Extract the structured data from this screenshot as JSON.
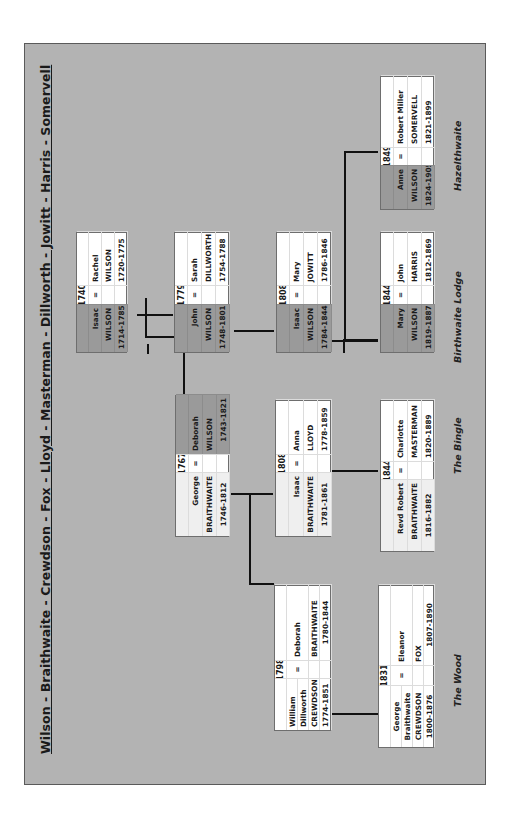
{
  "title": "Wilson - Braithwaite - Crewdson - Fox - Lloyd - Masterman - Dillworth - Jowitt - Harris - Somervell",
  "places": [
    {
      "label": "Hazelthwaite"
    },
    {
      "label": "Birthwaite Lodge"
    },
    {
      "label": "The Bingle"
    },
    {
      "label": "The Wood"
    }
  ],
  "couples": [
    {
      "id": "isaac-rachel",
      "year": "1740",
      "eq": "=",
      "left": {
        "names": [
          "Isaac",
          "WILSON"
        ],
        "dates": "1714-1785",
        "shade": "dark"
      },
      "right": {
        "names": [
          "Rachel",
          "WILSON"
        ],
        "dates": "1720-1775",
        "shade": "white"
      }
    },
    {
      "id": "john-sarah",
      "year": "1779",
      "eq": "=",
      "left": {
        "names": [
          "John",
          "WILSON"
        ],
        "dates": "1748-1801",
        "shade": "dark"
      },
      "right": {
        "names": [
          "Sarah",
          "DILLWORTH"
        ],
        "dates": "1754-1788",
        "shade": "white"
      }
    },
    {
      "id": "isaac-mary",
      "year": "1808",
      "eq": "=",
      "left": {
        "names": [
          "Isaac",
          "WILSON"
        ],
        "dates": "1784-1844",
        "shade": "dark"
      },
      "right": {
        "names": [
          "Mary",
          "JOWITT"
        ],
        "dates": "1786-1846",
        "shade": "white"
      }
    },
    {
      "id": "mary-john",
      "year": "1844",
      "eq": "=",
      "left": {
        "names": [
          "Mary",
          "WILSON"
        ],
        "dates": "1819-1887",
        "shade": "dark"
      },
      "right": {
        "names": [
          "John",
          "HARRIS"
        ],
        "dates": "1812-1869",
        "shade": "white"
      }
    },
    {
      "id": "anne-robert",
      "year": "1849",
      "eq": "=",
      "left": {
        "names": [
          "Anne",
          "WILSON"
        ],
        "dates": "1824-1905",
        "shade": "dark"
      },
      "right": {
        "names": [
          "Robert Miller",
          "SOMERVELL"
        ],
        "dates": "1821-1899",
        "shade": "white"
      }
    },
    {
      "id": "george-deborah",
      "year": "1767",
      "eq": "=",
      "left": {
        "names": [
          "George",
          "BRAITHWAITE"
        ],
        "dates": "1746-1812",
        "shade": "light"
      },
      "right": {
        "names": [
          "Deborah",
          "WILSON"
        ],
        "dates": "1743-1821",
        "shade": "dark"
      }
    },
    {
      "id": "isaac-anna",
      "year": "1808",
      "eq": "=",
      "left": {
        "names": [
          "Isaac",
          "BRAITHWAITE"
        ],
        "dates": "1781-1861",
        "shade": "light"
      },
      "right": {
        "names": [
          "Anna",
          "LLOYD"
        ],
        "dates": "1778-1859",
        "shade": "white"
      }
    },
    {
      "id": "robert-charlotte",
      "year": "1844",
      "eq": "=",
      "left": {
        "names": [
          "Revd Robert",
          "BRAITHWAITE"
        ],
        "dates": "1816-1882",
        "shade": "light"
      },
      "right": {
        "names": [
          "Charlotte",
          "MASTERMAN"
        ],
        "dates": "1820-1889",
        "shade": "white"
      }
    },
    {
      "id": "william-deborah",
      "year": "1798",
      "eq": "=",
      "left": {
        "names": [
          "William",
          "Dillworth",
          "CREWDSON"
        ],
        "dates": "1774-1851",
        "shade": "white"
      },
      "right": {
        "names": [
          "Deborah",
          "BRAITHWAITE"
        ],
        "dates": "1780-1844",
        "shade": "white"
      }
    },
    {
      "id": "george-eleanor",
      "year": "1831",
      "eq": "=",
      "left": {
        "names": [
          "George",
          "Braithwaite",
          "CREWDSON"
        ],
        "dates": "1800-1876",
        "shade": "white"
      },
      "right": {
        "names": [
          "Eleanor",
          "FOX"
        ],
        "dates": "1807-1890",
        "shade": "white"
      }
    }
  ]
}
